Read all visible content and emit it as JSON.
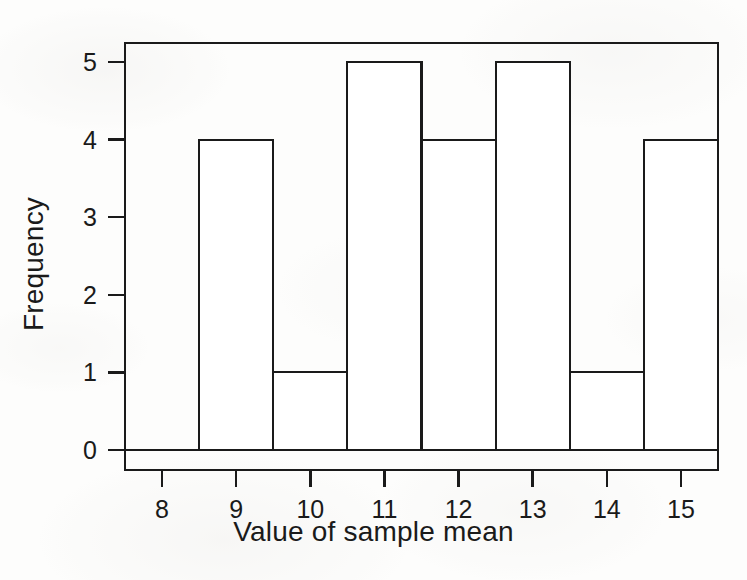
{
  "figure": {
    "width": 747,
    "height": 580,
    "background_color": "#fdfdfc",
    "ink_color": "#1a1a1a"
  },
  "chart_data": {
    "type": "bar",
    "subtype": "histogram",
    "title": "",
    "subtitle": "",
    "xlabel": "Value of sample mean",
    "ylabel": "Frequency",
    "categories": [
      "8",
      "9",
      "10",
      "11",
      "12",
      "13",
      "14",
      "15"
    ],
    "values": [
      0,
      4,
      1,
      5,
      4,
      5,
      1,
      4
    ],
    "bin_centers": [
      8,
      9,
      10,
      11,
      12,
      13,
      14,
      15
    ],
    "bin_edges": [
      7.5,
      8.5,
      9.5,
      10.5,
      11.5,
      12.5,
      13.5,
      14.5,
      15.5
    ],
    "bin_width": 1,
    "xtick_labels": [
      "8",
      "9",
      "10",
      "11",
      "12",
      "13",
      "14",
      "15"
    ],
    "xtick_values": [
      8,
      9,
      10,
      11,
      12,
      13,
      14,
      15
    ],
    "ytick_labels": [
      "0",
      "1",
      "2",
      "3",
      "4",
      "5"
    ],
    "ytick_values": [
      0,
      1,
      2,
      3,
      4,
      5
    ],
    "xlim": [
      7.5,
      15.5
    ],
    "ylim": [
      0,
      5.35
    ],
    "grid": false,
    "legend": false,
    "legend_position": "none",
    "bar_fill_color": "#ffffff",
    "bar_edge_color": "#1a1a1a",
    "frame": "box",
    "annotations": []
  },
  "axes": {
    "x_title": "Value of sample mean",
    "y_title": "Frequency"
  }
}
